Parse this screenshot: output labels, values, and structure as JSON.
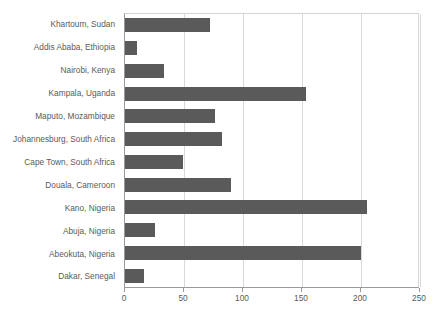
{
  "chart_data": {
    "type": "bar",
    "orientation": "horizontal",
    "title": "",
    "subtitle": "",
    "xlabel": "",
    "ylabel": "",
    "xlim": [
      0,
      250
    ],
    "xticks": [
      0,
      50,
      100,
      150,
      200,
      250
    ],
    "xtick_labels": [
      "0",
      "50",
      "100",
      "150",
      "200",
      "250"
    ],
    "grid": "vertical",
    "legend": "none",
    "bar_color": "#5a5a5a",
    "text_color": "#5a5a5a",
    "gridline_color": "#d9d9d9",
    "axis_color": "#9a9a9a",
    "plot_border_color": "#d4d4d4",
    "background_color": "#ffffff",
    "categories": [
      "Khartoum, Sudan",
      "Addis Ababa, Ethiopia",
      "Nairobi, Kenya",
      "Kampala, Uganda",
      "Maputo, Mozambique",
      "Johannesburg, South Africa",
      "Cape Town, South Africa",
      "Douala, Cameroon",
      "Kano, Nigeria",
      "Abuja, Nigeria",
      "Abeokuta, Nigeria",
      "Dakar, Senegal"
    ],
    "values": [
      72,
      10,
      33,
      153,
      76,
      82,
      49,
      90,
      205,
      25,
      200,
      16
    ]
  }
}
